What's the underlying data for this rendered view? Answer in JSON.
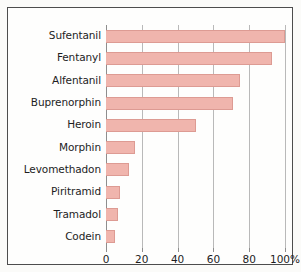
{
  "chart_data": {
    "type": "bar",
    "orientation": "horizontal",
    "title": "",
    "xlabel": "",
    "ylabel": "",
    "xlim": [
      0,
      100
    ],
    "xticks": [
      0,
      20,
      40,
      60,
      80,
      100
    ],
    "xtick_labels": [
      "0",
      "20",
      "40",
      "60",
      "80",
      "100%"
    ],
    "grid": true,
    "legend": false,
    "categories": [
      "Sufentanil",
      "Fentanyl",
      "Alfentanil",
      "Buprenorphin",
      "Heroin",
      "Morphin",
      "Levomethadon",
      "Piritramid",
      "Tramadol",
      "Codein"
    ],
    "values": [
      100,
      93,
      75,
      71,
      50,
      16,
      13,
      8,
      6.5,
      5
    ],
    "bar_color": "#f0b5ad",
    "bar_border_color": "#dd9b93",
    "grid_color": "#b9b9b9",
    "axis_color": "#8e8e8e",
    "text_color": "#1d1d1d",
    "frame_color": "#4d4d4d",
    "background_color": "#fefefd"
  }
}
